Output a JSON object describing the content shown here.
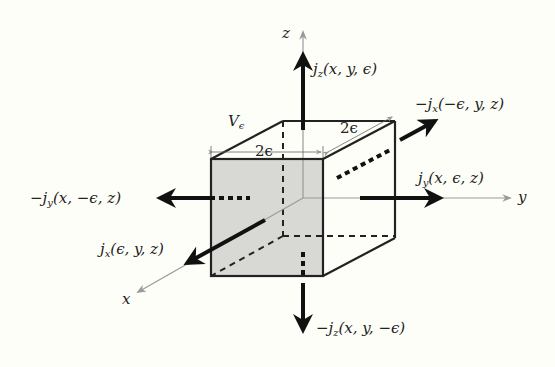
{
  "diagram": {
    "colors": {
      "background": "#fefef9",
      "face_fill": "#d8d8d4",
      "line": "#222222",
      "axis": "#888888"
    },
    "cube": {
      "label": "Vϵ",
      "label_main": "V",
      "label_sub": "ϵ",
      "edge_front": "2ϵ",
      "edge_depth": "2ϵ"
    },
    "axes": {
      "x": "x",
      "y": "y",
      "z": "z"
    },
    "fluxes": {
      "jz_top": {
        "prefix": "j",
        "sub": "z",
        "args": "(x, y, ϵ)"
      },
      "jz_bottom": {
        "prefix": "−j",
        "sub": "z",
        "args": "(x, y, −ϵ)"
      },
      "jy_right": {
        "prefix": "j",
        "sub": "y",
        "args": "(x, ϵ, z)"
      },
      "jy_left": {
        "prefix": "−j",
        "sub": "y",
        "args": "(x, −ϵ, z)"
      },
      "jx_front": {
        "prefix": "j",
        "sub": "x",
        "args": "(ϵ, y, z)"
      },
      "jx_back": {
        "prefix": "−j",
        "sub": "x",
        "args": "(−ϵ, y, z)"
      }
    }
  }
}
